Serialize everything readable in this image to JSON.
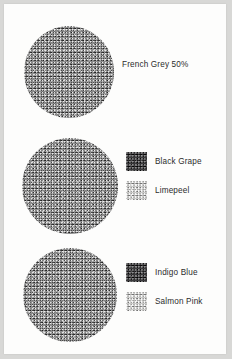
{
  "page": {
    "background_color": "#fdfdfc",
    "frame_color": "#d8d8d6"
  },
  "groups": [
    {
      "id": "group-1",
      "circle": {
        "name": "textured-circle-swatch",
        "color": "#8d8d8d",
        "cx": 68,
        "cy": 71,
        "r": 45
      },
      "samples": [
        {
          "label": "French Grey 50%",
          "swatch_visible": false,
          "color": "#8d8d8d"
        }
      ]
    },
    {
      "id": "group-2",
      "circle": {
        "name": "textured-circle-swatch",
        "color": "#8d8d8d",
        "cx": 68,
        "cy": 185,
        "r": 47
      },
      "samples": [
        {
          "label": "Black Grape",
          "swatch_visible": true,
          "color": "#3c3b3d"
        },
        {
          "label": "Limepeel",
          "swatch_visible": true,
          "color": "#c9c9c7"
        }
      ]
    },
    {
      "id": "group-3",
      "circle": {
        "name": "textured-circle-swatch",
        "color": "#8d8d8d",
        "cx": 68,
        "cy": 294,
        "r": 46
      },
      "samples": [
        {
          "label": "Indigo Blue",
          "swatch_visible": true,
          "color": "#3c3b3d"
        },
        {
          "label": "Salmon Pink",
          "swatch_visible": true,
          "color": "#c9c9c7"
        }
      ]
    }
  ]
}
